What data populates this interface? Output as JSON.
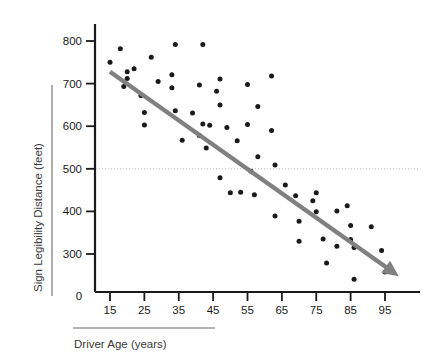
{
  "chart_data": {
    "type": "scatter",
    "title": "",
    "xlabel": "Driver Age (years)",
    "ylabel": "Sign Legibility Distance (feet)",
    "xlim": [
      10,
      100
    ],
    "ylim": [
      0,
      850
    ],
    "x_ticks": [
      15,
      25,
      35,
      45,
      55,
      65,
      75,
      85,
      95
    ],
    "y_ticks": [
      300,
      400,
      500,
      600,
      700,
      800
    ],
    "y_origin_label": "0",
    "grid": false,
    "legend": null,
    "marker_color": "#1a1a1a",
    "trend_color": "#808080",
    "reference_line": {
      "orientation": "horizontal",
      "value": 500,
      "style": "dotted",
      "color": "#bdbdbd"
    },
    "trend_line": {
      "type": "linear-fit-with-arrow",
      "x_start": 15,
      "y_start": 728,
      "x_end": 99,
      "y_end": 248,
      "arrow_head": true
    },
    "points": [
      {
        "x": 15,
        "y": 750
      },
      {
        "x": 18,
        "y": 782
      },
      {
        "x": 19,
        "y": 693
      },
      {
        "x": 20,
        "y": 728
      },
      {
        "x": 20,
        "y": 712
      },
      {
        "x": 22,
        "y": 735
      },
      {
        "x": 24,
        "y": 672
      },
      {
        "x": 25,
        "y": 632
      },
      {
        "x": 25,
        "y": 603
      },
      {
        "x": 27,
        "y": 762
      },
      {
        "x": 29,
        "y": 705
      },
      {
        "x": 33,
        "y": 721
      },
      {
        "x": 33,
        "y": 690
      },
      {
        "x": 34,
        "y": 792
      },
      {
        "x": 34,
        "y": 636
      },
      {
        "x": 36,
        "y": 567
      },
      {
        "x": 39,
        "y": 631
      },
      {
        "x": 41,
        "y": 697
      },
      {
        "x": 42,
        "y": 605
      },
      {
        "x": 42,
        "y": 792
      },
      {
        "x": 41,
        "y": 578
      },
      {
        "x": 43,
        "y": 549
      },
      {
        "x": 44,
        "y": 602
      },
      {
        "x": 46,
        "y": 682
      },
      {
        "x": 47,
        "y": 711
      },
      {
        "x": 47,
        "y": 650
      },
      {
        "x": 47,
        "y": 479
      },
      {
        "x": 49,
        "y": 597
      },
      {
        "x": 50,
        "y": 444
      },
      {
        "x": 52,
        "y": 566
      },
      {
        "x": 53,
        "y": 445
      },
      {
        "x": 55,
        "y": 698
      },
      {
        "x": 55,
        "y": 604
      },
      {
        "x": 56,
        "y": 494
      },
      {
        "x": 57,
        "y": 439
      },
      {
        "x": 58,
        "y": 646
      },
      {
        "x": 58,
        "y": 528
      },
      {
        "x": 62,
        "y": 590
      },
      {
        "x": 62,
        "y": 718
      },
      {
        "x": 63,
        "y": 509
      },
      {
        "x": 63,
        "y": 389
      },
      {
        "x": 66,
        "y": 462
      },
      {
        "x": 69,
        "y": 437
      },
      {
        "x": 70,
        "y": 377
      },
      {
        "x": 70,
        "y": 330
      },
      {
        "x": 74,
        "y": 425
      },
      {
        "x": 75,
        "y": 444
      },
      {
        "x": 75,
        "y": 399
      },
      {
        "x": 77,
        "y": 335
      },
      {
        "x": 78,
        "y": 279
      },
      {
        "x": 81,
        "y": 401
      },
      {
        "x": 81,
        "y": 318
      },
      {
        "x": 84,
        "y": 413
      },
      {
        "x": 85,
        "y": 367
      },
      {
        "x": 85,
        "y": 334
      },
      {
        "x": 86,
        "y": 315
      },
      {
        "x": 86,
        "y": 241
      },
      {
        "x": 91,
        "y": 364
      },
      {
        "x": 94,
        "y": 308
      },
      {
        "x": 95,
        "y": 258
      }
    ]
  },
  "axes": {
    "y_title": "Sign Legibility Distance (feet)",
    "x_title": "Driver Age (years)"
  }
}
